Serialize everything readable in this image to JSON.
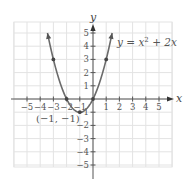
{
  "chart_data": {
    "type": "line",
    "title": "",
    "equation_label": "y = x² + 2x",
    "xlabel": "x",
    "ylabel": "y",
    "xlim": [
      -6,
      6
    ],
    "ylim": [
      -6,
      6
    ],
    "grid": true,
    "x_ticks": [
      -5,
      -4,
      -3,
      -2,
      -1,
      1,
      2,
      3,
      4,
      5
    ],
    "y_ticks": [
      -5,
      -4,
      -3,
      -2,
      -1,
      1,
      2,
      3,
      4,
      5
    ],
    "x_tick_labels": [
      "−5",
      "−4",
      "−3",
      "−2",
      "−1",
      "1",
      "2",
      "3",
      "4",
      "5"
    ],
    "y_tick_labels": [
      "−5",
      "−4",
      "−3",
      "−2",
      "−1",
      "1",
      "2",
      "3",
      "4",
      "5"
    ],
    "series": [
      {
        "name": "y = x² + 2x",
        "function": "x^2 + 2x",
        "x_range": [
          -3.45,
          1.45
        ],
        "color": "#6b6b6b"
      }
    ],
    "points": [
      {
        "x": -3,
        "y": 3
      },
      {
        "x": -2,
        "y": 0
      },
      {
        "x": -1,
        "y": -1
      },
      {
        "x": 0,
        "y": 0
      },
      {
        "x": 1,
        "y": 3
      }
    ],
    "annotations": [
      {
        "text": "(−1, −1)",
        "x": -1,
        "y": -1
      }
    ]
  },
  "labels": {
    "equation": "y = x",
    "equation_sup": "2",
    "equation_rest": " + 2x",
    "vertex": "(−1, −1)",
    "x_axis": "x",
    "y_axis": "y"
  }
}
